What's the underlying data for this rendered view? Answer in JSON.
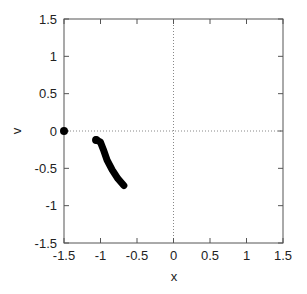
{
  "chart_data": {
    "type": "line",
    "title": "",
    "xlabel": "x",
    "ylabel": "v",
    "xlim": [
      -1.5,
      1.5
    ],
    "ylim": [
      -1.5,
      1.5
    ],
    "xticks": [
      -1.5,
      -1,
      -0.5,
      0,
      0.5,
      1,
      1.5
    ],
    "yticks": [
      -1.5,
      -1,
      -0.5,
      0,
      0.5,
      1,
      1.5
    ],
    "xtick_labels": [
      "-1.5",
      "-1",
      "-0.5",
      "0",
      "0.5",
      "1",
      "1.5"
    ],
    "ytick_labels": [
      "-1.5",
      "-1",
      "-0.5",
      "0",
      "0.5",
      "1",
      "1.5"
    ],
    "grid": false,
    "reference_lines": [
      {
        "orientation": "horizontal",
        "value": 0,
        "style": "dotted"
      },
      {
        "orientation": "vertical",
        "value": 0,
        "style": "dotted"
      }
    ],
    "series": [
      {
        "name": "trajectory",
        "style": "thick-markers",
        "color": "#000000",
        "x": [
          -1.06,
          -1.0,
          -0.96,
          -0.91,
          -0.84,
          -0.76,
          -0.68
        ],
        "y": [
          -0.12,
          -0.15,
          -0.25,
          -0.39,
          -0.52,
          -0.64,
          -0.73
        ]
      },
      {
        "name": "point",
        "style": "marker",
        "color": "#000000",
        "x": [
          -1.5
        ],
        "y": [
          0
        ]
      }
    ],
    "legend": null
  }
}
